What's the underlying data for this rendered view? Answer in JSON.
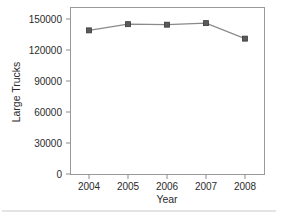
{
  "chart_data": {
    "type": "line",
    "title": "",
    "subtitle": "",
    "xlabel": "Year",
    "ylabel": "Large Trucks",
    "categories": [
      "2004",
      "2005",
      "2006",
      "2007",
      "2008"
    ],
    "values": [
      139000,
      145000,
      144500,
      146000,
      131000
    ],
    "series": [
      {
        "name": "Large Trucks",
        "values": [
          139000,
          145000,
          144500,
          146000,
          131000
        ]
      }
    ],
    "x_tick_labels": [
      "2004",
      "2005",
      "2006",
      "2007",
      "2008"
    ],
    "y_tick_labels": [
      "0",
      "30000",
      "60000",
      "90000",
      "120000",
      "150000"
    ],
    "y_tick_values": [
      0,
      30000,
      60000,
      90000,
      120000,
      150000
    ],
    "ylim": [
      0,
      155000
    ],
    "xlim": [
      2003.5,
      2008.5
    ],
    "grid": false,
    "legend": false,
    "legend_position": "none",
    "marker": "square",
    "line_color": "#8a8a8a",
    "marker_color": "#5a5a5a",
    "frame_color": "#9a9a9a",
    "background_color": "#ffffff",
    "annotations": []
  },
  "axes": {
    "y_title": "Large Trucks",
    "x_title": "Year",
    "y_ticks": [
      {
        "label": "150000"
      },
      {
        "label": "120000"
      },
      {
        "label": "90000"
      },
      {
        "label": "60000"
      },
      {
        "label": "30000"
      },
      {
        "label": "0"
      }
    ],
    "x_ticks": [
      {
        "label": "2004"
      },
      {
        "label": "2005"
      },
      {
        "label": "2006"
      },
      {
        "label": "2007"
      },
      {
        "label": "2008"
      }
    ]
  }
}
